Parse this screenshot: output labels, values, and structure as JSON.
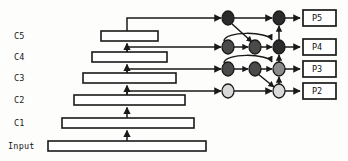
{
  "diagram": {
    "background_color": "#fdfdfc",
    "stroke_color": "#1a1a1a",
    "backbone": {
      "label_names": [
        "C5",
        "C4",
        "C3",
        "C2",
        "C1",
        "Input"
      ],
      "levels": [
        {
          "name": "C5",
          "label": "C5",
          "bar_x": 101,
          "bar_y": 31,
          "bar_w": 57,
          "bar_h": 10
        },
        {
          "name": "C4",
          "label": "C4",
          "bar_x": 92,
          "bar_y": 52,
          "bar_w": 75,
          "bar_h": 10
        },
        {
          "name": "C3",
          "label": "C3",
          "bar_x": 83,
          "bar_y": 73,
          "bar_w": 93,
          "bar_h": 10
        },
        {
          "name": "C2",
          "label": "C2",
          "bar_x": 74,
          "bar_y": 95,
          "bar_w": 111,
          "bar_h": 10
        },
        {
          "name": "C1",
          "label": "C1",
          "bar_x": 62,
          "bar_y": 118,
          "bar_w": 132,
          "bar_h": 10
        },
        {
          "name": "Input",
          "label": "Input",
          "bar_x": 48,
          "bar_y": 141,
          "bar_w": 158,
          "bar_h": 10
        }
      ]
    },
    "pyramid": {
      "output_labels": [
        "P5",
        "P4",
        "P3",
        "P2"
      ],
      "outputs": [
        {
          "name": "P5",
          "label": "P5",
          "box_x": 303,
          "box_y": 10,
          "box_w": 33,
          "box_h": 16
        },
        {
          "name": "P4",
          "label": "P4",
          "box_x": 303,
          "box_y": 39,
          "box_w": 33,
          "box_h": 16
        },
        {
          "name": "P3",
          "label": "P3",
          "box_x": 303,
          "box_y": 62,
          "box_w": 33,
          "box_h": 16
        },
        {
          "name": "P2",
          "label": "P2",
          "box_x": 303,
          "box_y": 84,
          "box_w": 33,
          "box_h": 16
        }
      ]
    },
    "nodes": {
      "column_a_x": 228,
      "column_b_x": 255,
      "column_c_x": 279,
      "row_y": [
        18,
        47,
        69,
        91
      ],
      "radius_x": 6,
      "radius_y": 7,
      "fills": {
        "dark": "#2b2b2b",
        "mid_dark": "#4a4a4a",
        "mid": "#8c8c8c",
        "light": "#d9d9d9"
      },
      "items": [
        {
          "name": "node-a-p5",
          "col": "a",
          "row": 0,
          "fill": "dark"
        },
        {
          "name": "node-a-p4",
          "col": "a",
          "row": 1,
          "fill": "mid_dark"
        },
        {
          "name": "node-a-p3",
          "col": "a",
          "row": 2,
          "fill": "mid_dark"
        },
        {
          "name": "node-a-p2",
          "col": "a",
          "row": 3,
          "fill": "light"
        },
        {
          "name": "node-b-p4",
          "col": "b",
          "row": 1,
          "fill": "mid_dark"
        },
        {
          "name": "node-b-p3",
          "col": "b",
          "row": 2,
          "fill": "mid_dark"
        },
        {
          "name": "node-c-p5",
          "col": "c",
          "row": 0,
          "fill": "dark"
        },
        {
          "name": "node-c-p4",
          "col": "c",
          "row": 1,
          "fill": "dark"
        },
        {
          "name": "node-c-p3",
          "col": "c",
          "row": 2,
          "fill": "mid"
        },
        {
          "name": "node-c-p2",
          "col": "c",
          "row": 3,
          "fill": "light"
        }
      ]
    },
    "labels_x": 14,
    "label_positions_y": [
      36,
      57,
      78,
      100,
      123,
      146
    ],
    "spine_x": 127
  }
}
